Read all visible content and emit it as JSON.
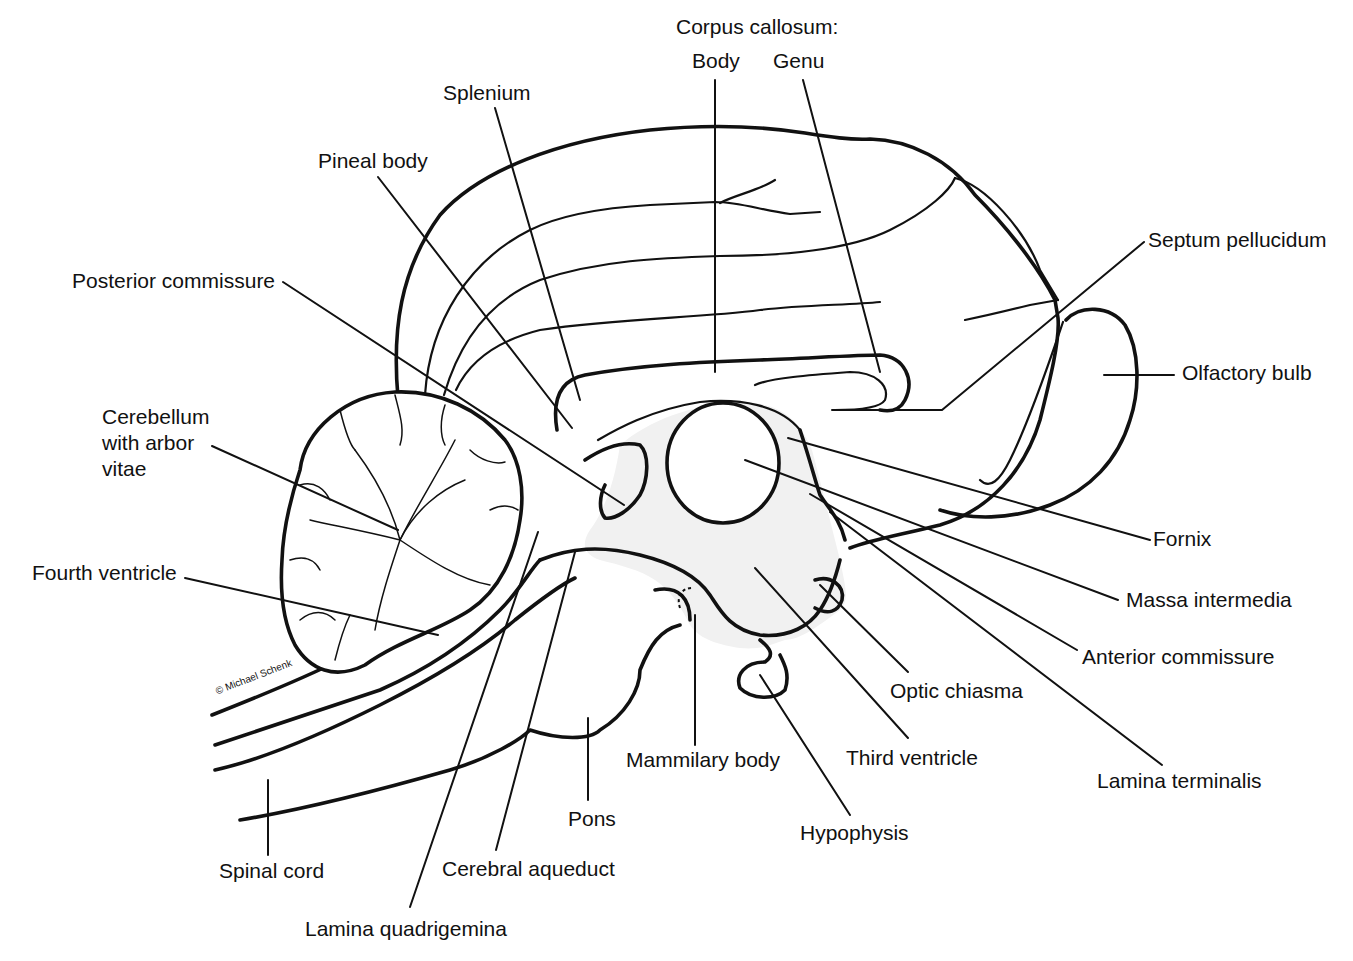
{
  "title": "Corpus callosum:",
  "credit": "© Michael Schenk",
  "labels": {
    "corpus_callosum_heading": "Corpus callosum:",
    "body": "Body",
    "genu": "Genu",
    "splenium": "Splenium",
    "pineal_body": "Pineal body",
    "posterior_commissure": "Posterior commissure",
    "septum_pellucidum": "Septum pellucidum",
    "olfactory_bulb": "Olfactory bulb",
    "cerebellum": "Cerebellum\nwith arbor\nvitae",
    "fourth_ventricle": "Fourth ventricle",
    "fornix": "Fornix",
    "massa_intermedia": "Massa intermedia",
    "anterior_commissure": "Anterior commissure",
    "optic_chiasma": "Optic chiasma",
    "lamina_terminalis": "Lamina terminalis",
    "third_ventricle": "Third ventricle",
    "mammilary_body": "Mammilary body",
    "hypophysis": "Hypophysis",
    "pons": "Pons",
    "spinal_cord": "Spinal cord",
    "cerebral_aqueduct": "Cerebral aqueduct",
    "lamina_quadrigemina": "Lamina quadrigemina"
  },
  "colors": {
    "ink": "#111111",
    "background": "#ffffff",
    "ventricle_fill": "#f1f1f1"
  }
}
